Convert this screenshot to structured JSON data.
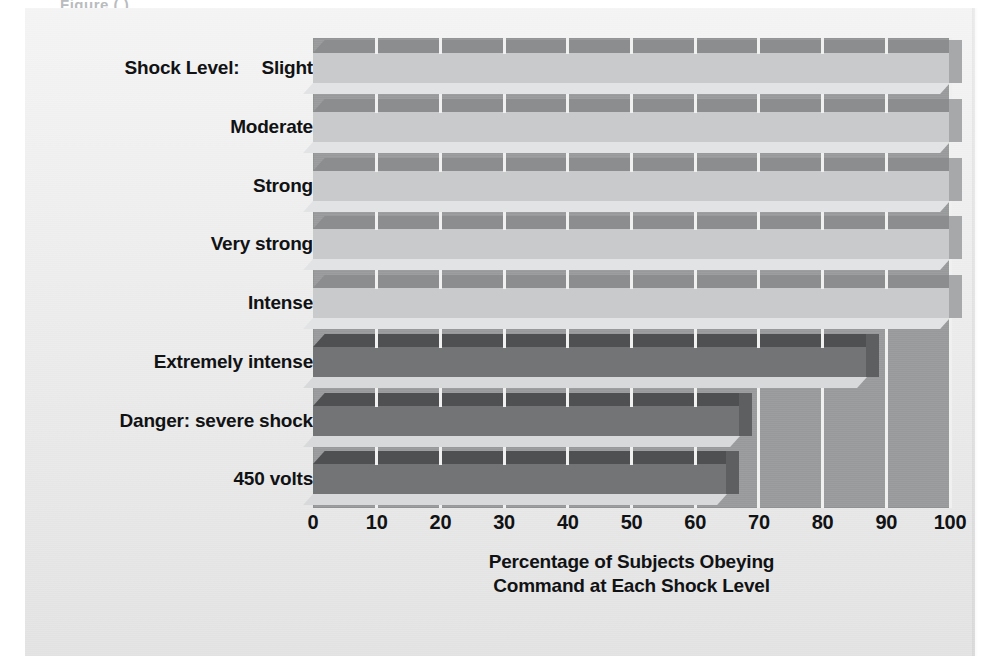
{
  "figure": {
    "clipped_header_text": "Figure  (  )",
    "category_axis_prefix": "Shock Level:"
  },
  "chart_data": {
    "type": "bar",
    "orientation": "horizontal",
    "title": "",
    "xlabel": "Percentage of Subjects Obeying Command at Each Shock Level",
    "xlabel_lines": [
      "Percentage of Subjects Obeying",
      "Command at Each Shock Level"
    ],
    "ylabel": "Shock Level:",
    "categories": [
      "Slight",
      "Moderate",
      "Strong",
      "Very strong",
      "Intense",
      "Extremely intense",
      "Danger: severe shock",
      "450 volts"
    ],
    "values": [
      100,
      100,
      100,
      100,
      100,
      87,
      67,
      65
    ],
    "xlim": [
      0,
      100
    ],
    "xticks": [
      0,
      10,
      20,
      30,
      40,
      50,
      60,
      70,
      80,
      90,
      100
    ],
    "xtick_labels": [
      "0",
      "10",
      "20",
      "30",
      "40",
      "50",
      "60",
      "70",
      "80",
      "90",
      "100"
    ],
    "grid": true,
    "grid_axis": "x",
    "grid_color": "#f0f0f0",
    "legend": null,
    "bar_styles": [
      "light",
      "light",
      "light",
      "light",
      "light",
      "dark",
      "dark",
      "dark"
    ],
    "colors": {
      "plot_background": "#9a9c9e",
      "figure_background": "#ececed",
      "bar_light_front": "#c9cacb",
      "bar_light_top": "#8b8d8f",
      "bar_dark_front": "#727476",
      "bar_dark_top": "#4e5052",
      "text": "#111214"
    }
  }
}
